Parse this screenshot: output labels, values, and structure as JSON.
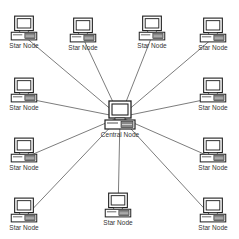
{
  "diagram": {
    "type": "star-network-topology",
    "central": {
      "label": "Central Node",
      "x": 120,
      "y": 115
    },
    "nodes": [
      {
        "label": "Star Node",
        "x": 24,
        "y": 28
      },
      {
        "label": "Star Node",
        "x": 83,
        "y": 30
      },
      {
        "label": "Star Node",
        "x": 152,
        "y": 28
      },
      {
        "label": "Star Node",
        "x": 213,
        "y": 30
      },
      {
        "label": "Star Node",
        "x": 24,
        "y": 90
      },
      {
        "label": "Star Node",
        "x": 213,
        "y": 90
      },
      {
        "label": "Star Node",
        "x": 24,
        "y": 150
      },
      {
        "label": "Star Node",
        "x": 213,
        "y": 150
      },
      {
        "label": "Star Node",
        "x": 24,
        "y": 210
      },
      {
        "label": "Star Node",
        "x": 118,
        "y": 205
      },
      {
        "label": "Star Node",
        "x": 213,
        "y": 210
      },
      {
        "label": "Star Node",
        "x": 120,
        "y": 205
      }
    ],
    "colors": {
      "line": "#444444",
      "stroke": "#222222",
      "background": "#ffffff"
    }
  }
}
